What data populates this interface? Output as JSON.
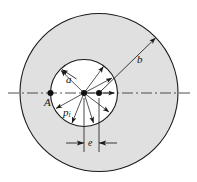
{
  "figure": {
    "type": "engineering-cross-section-diagram",
    "colors": {
      "material_fill": "#e0e0e0",
      "bore_fill": "#ffffff",
      "stroke": "#1a1a1a",
      "background": "#ffffff"
    },
    "labels": {
      "outer_radius": "b",
      "inner_radius": "a",
      "point": "A",
      "eccentricity": "e",
      "internal_pressure": "p",
      "internal_pressure_sub": "i"
    },
    "geometry": {
      "outer_circle": {
        "cx": 99,
        "cy": 92.5,
        "r": 79
      },
      "inner_circle": {
        "cx": 84,
        "cy": 93,
        "r": 33.5
      },
      "outer_center_dot": {
        "cx": 99,
        "cy": 93
      },
      "inner_center_dot": {
        "cx": 84,
        "cy": 93
      },
      "point_A": {
        "cx": 50.5,
        "cy": 93
      },
      "eccentricity_dim_y": 143,
      "centerline_y": 93,
      "centerline_x1": 8,
      "centerline_x2": 190
    },
    "pressure_arrow_count": 8
  }
}
